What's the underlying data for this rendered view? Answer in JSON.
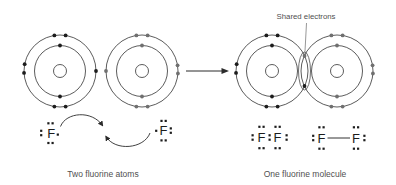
{
  "labels": {
    "shared_electrons": "Shared electrons",
    "caption_left": "Two fluorine atoms",
    "caption_right": "One fluorine molecule"
  },
  "colors": {
    "background": "#ffffff",
    "ring": "#4a4a4a",
    "electron_dark": "#1c1c1c",
    "electron_gray": "#6f6f6f",
    "text": "#4f4f4f",
    "symbol": "#1c1c1c",
    "line": "#2b2b2b",
    "pointer": "#6a6a6a"
  },
  "figure": {
    "width": 396,
    "height": 185,
    "bohr": {
      "outer_r": 36,
      "inner_r": 25.5,
      "nucleus_r": 6.5,
      "electron_r": 1.9,
      "atoms": [
        {
          "id": "fluorine-atom-1",
          "cx": 60,
          "cy": 71,
          "shade": "dark",
          "outer": [
            261,
            279,
            177,
            191,
            81,
            99,
            0
          ],
          "inner": [
            270,
            90
          ]
        },
        {
          "id": "fluorine-atom-2",
          "cx": 142,
          "cy": 71,
          "shade": "gray",
          "outer": [
            261,
            279,
            351,
            4,
            81,
            99,
            180
          ],
          "inner": [
            270,
            90
          ]
        },
        {
          "id": "fluorine-atom-3",
          "cx": 272,
          "cy": 71,
          "shade": "dark",
          "outer": [
            261,
            279,
            177,
            191,
            81,
            99
          ],
          "inner": [
            270,
            90
          ]
        },
        {
          "id": "fluorine-atom-4",
          "cx": 337,
          "cy": 71,
          "shade": "gray",
          "outer": [
            261,
            279,
            351,
            4,
            81,
            99
          ],
          "inner": [
            270,
            90
          ]
        }
      ],
      "shared_pair": {
        "ellipse": {
          "cx": 304.5,
          "cy": 71,
          "rx": 6,
          "ry": 19
        },
        "electrons": [
          {
            "x": 304.5,
            "y": 56,
            "shade": "gray"
          },
          {
            "x": 304.5,
            "y": 86,
            "shade": "dark"
          }
        ],
        "pointer": {
          "x1": 306.5,
          "y1": 23,
          "x2": 304.8,
          "y2": 55
        }
      }
    },
    "reaction_arrow": {
      "x1": 186,
      "y1": 71,
      "x2": 222,
      "y2": 71,
      "tip_x": 229,
      "half_h": 3
    },
    "lewis": {
      "symbol": "F",
      "font_size": 13,
      "dot_size": 2.2,
      "structures": [
        {
          "id": "lewis-left-atom",
          "symbols": [
            [
              51.3,
              133
            ]
          ],
          "dots": [
            [
              48.4,
              123.3
            ],
            [
              52.6,
              123.3
            ],
            [
              41.2,
              130.8
            ],
            [
              41.2,
              135.2
            ],
            [
              48.4,
              143
            ],
            [
              52.6,
              143
            ],
            [
              57.8,
              134.6
            ]
          ]
        },
        {
          "id": "lewis-right-atom",
          "symbols": [
            [
              163.6,
              130.6
            ]
          ],
          "dots": [
            [
              161.5,
              120.9
            ],
            [
              165.7,
              120.9
            ],
            [
              170.8,
              128.4
            ],
            [
              170.8,
              132.8
            ],
            [
              161.5,
              140.4
            ],
            [
              165.7,
              140.4
            ],
            [
              156.2,
              130.8
            ]
          ]
        },
        {
          "id": "lewis-molecule-dots",
          "symbols": [
            [
              261.5,
              137.5
            ],
            [
              277.6,
              137.5
            ]
          ],
          "dots": [
            [
              259.4,
              126.8
            ],
            [
              263.6,
              126.8
            ],
            [
              275.5,
              126.8
            ],
            [
              279.7,
              126.8
            ],
            [
              259.4,
              148.2
            ],
            [
              263.6,
              148.2
            ],
            [
              275.5,
              148.2
            ],
            [
              279.7,
              148.2
            ],
            [
              252.6,
              135.3
            ],
            [
              252.6,
              139.7
            ],
            [
              269.6,
              135.3
            ],
            [
              269.6,
              139.7
            ],
            [
              286.6,
              135.3
            ],
            [
              286.6,
              139.7
            ]
          ]
        },
        {
          "id": "lewis-molecule-bond",
          "symbols": [
            [
              321.5,
              138
            ],
            [
              356,
              138
            ]
          ],
          "dots": [
            [
              319.4,
              127.3
            ],
            [
              323.6,
              127.3
            ],
            [
              353.9,
              127.3
            ],
            [
              358.1,
              127.3
            ],
            [
              319.4,
              148.7
            ],
            [
              323.6,
              148.7
            ],
            [
              353.9,
              148.7
            ],
            [
              358.1,
              148.7
            ],
            [
              313.2,
              135.8
            ],
            [
              313.2,
              140.2
            ],
            [
              364.4,
              135.8
            ],
            [
              364.4,
              140.2
            ]
          ],
          "bond": [
            327.5,
            138,
            350,
            138
          ]
        }
      ],
      "curved_arrows": [
        "M 60.5,126.5 C 66,112 92,110 102.5,125.5",
        "M 150,133 C 144,149 115,151.5 106,136.5"
      ]
    },
    "captions": [
      {
        "key": "caption_left",
        "name": "caption-two-fluorine-atoms",
        "x": 103,
        "y": 176.5,
        "font_size": 8.5
      },
      {
        "key": "caption_right",
        "name": "caption-one-fluorine-molecule",
        "x": 305,
        "y": 176.5,
        "font_size": 8.5
      }
    ],
    "shared_label": {
      "x": 306,
      "y": 18.5,
      "font_size": 7.8
    }
  }
}
